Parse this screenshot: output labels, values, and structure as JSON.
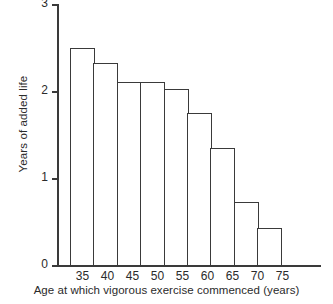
{
  "chart_data": {
    "type": "bar",
    "title": "",
    "xlabel": "Age at which vigorous exercise commenced (years)",
    "ylabel": "Years of added life",
    "categories": [
      "35",
      "40",
      "45",
      "50",
      "55",
      "60",
      "65",
      "70",
      "75"
    ],
    "values": [
      2.5,
      2.32,
      2.1,
      2.1,
      2.02,
      1.75,
      1.35,
      0.72,
      0.43
    ],
    "ylim": [
      0,
      3
    ],
    "yticks": [
      "0",
      "1",
      "2",
      "3"
    ],
    "ytick_values": [
      0,
      1,
      2,
      3
    ],
    "grid": false,
    "legend": null,
    "bar_style": {
      "fill": "#ffffff",
      "stroke": "#3a3a3a",
      "gap": 0
    },
    "axis_color": "#3a3a3a"
  }
}
